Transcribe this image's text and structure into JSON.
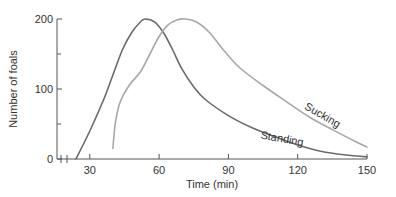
{
  "chart_data": {
    "type": "line",
    "title": "",
    "xlabel": "Time (min)",
    "ylabel": "Number of foals",
    "xlim": [
      0,
      150
    ],
    "ylim": [
      0,
      200
    ],
    "x_ticks": [
      30,
      60,
      90,
      120,
      150
    ],
    "y_ticks": [
      0,
      100,
      200
    ],
    "y_minor_ticks": [
      50,
      150
    ],
    "axis_break": true,
    "grid": false,
    "legend": "inline labels",
    "series": [
      {
        "name": "Standing",
        "color": "#6b6b6b",
        "label_pos": {
          "t": 113,
          "n": 24,
          "angle": 10
        },
        "points": [
          [
            24,
            0
          ],
          [
            30,
            40
          ],
          [
            36,
            85
          ],
          [
            40,
            120
          ],
          [
            44,
            155
          ],
          [
            48,
            180
          ],
          [
            52,
            196
          ],
          [
            54,
            200
          ],
          [
            58,
            196
          ],
          [
            62,
            180
          ],
          [
            66,
            155
          ],
          [
            70,
            128
          ],
          [
            75,
            103
          ],
          [
            80,
            85
          ],
          [
            90,
            62
          ],
          [
            100,
            45
          ],
          [
            110,
            32
          ],
          [
            120,
            20
          ],
          [
            130,
            11
          ],
          [
            140,
            6
          ],
          [
            150,
            3
          ]
        ]
      },
      {
        "name": "Sucking",
        "color": "#a8a8a8",
        "label_pos": {
          "t": 130,
          "n": 58,
          "angle": 30
        },
        "points": [
          [
            40,
            15
          ],
          [
            41,
            50
          ],
          [
            43,
            80
          ],
          [
            47,
            105
          ],
          [
            52,
            125
          ],
          [
            56,
            150
          ],
          [
            60,
            175
          ],
          [
            64,
            192
          ],
          [
            68,
            199
          ],
          [
            71,
            200
          ],
          [
            76,
            196
          ],
          [
            82,
            180
          ],
          [
            88,
            155
          ],
          [
            95,
            130
          ],
          [
            105,
            105
          ],
          [
            115,
            82
          ],
          [
            125,
            60
          ],
          [
            135,
            42
          ],
          [
            145,
            25
          ],
          [
            150,
            17
          ]
        ]
      }
    ]
  }
}
